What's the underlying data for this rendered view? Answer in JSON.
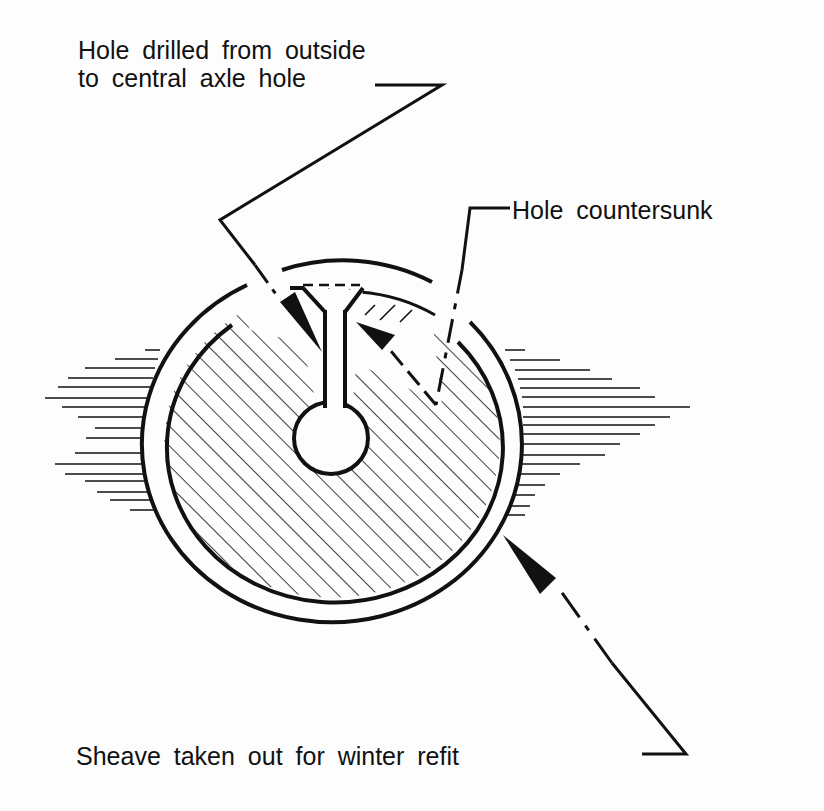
{
  "labels": {
    "drilled_line1": "Hole drilled from outside",
    "drilled_line2": "to central axle hole",
    "countersunk": "Hole countersunk",
    "sheave": "Sheave taken out for winter refit"
  },
  "colors": {
    "ink": "#111111",
    "background": "#fdfdfd"
  }
}
